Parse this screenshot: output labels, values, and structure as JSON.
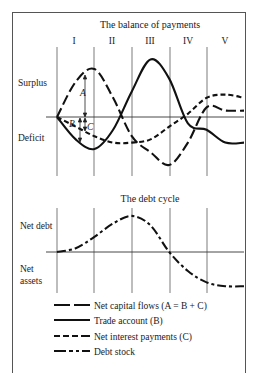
{
  "balance_chart": {
    "title": "The balance of payments",
    "phases": [
      "I",
      "II",
      "III",
      "IV",
      "V"
    ],
    "y_labels": {
      "top": "Surplus",
      "bottom": "Deficit"
    },
    "annotations": {
      "a": "A",
      "b": "B",
      "c": "C"
    }
  },
  "debt_chart": {
    "title": "The debt cycle",
    "y_labels": {
      "top": "Net debt",
      "bottom_line1": "Net",
      "bottom_line2": "assets"
    }
  },
  "legend": [
    {
      "style": "long-dash",
      "label": "Net capital flows (A = B + C)"
    },
    {
      "style": "solid",
      "label": "Trade account (B)"
    },
    {
      "style": "short-dash",
      "label": "Net interest payments (C)"
    },
    {
      "style": "dash-dot",
      "label": "Debt stock"
    }
  ],
  "chart_data": [
    {
      "type": "line",
      "title": "The balance of payments",
      "x": [
        0,
        0.5,
        1,
        1.5,
        2,
        2.5,
        3,
        3.5,
        4,
        4.5,
        5
      ],
      "categories": [
        "I",
        "II",
        "III",
        "IV",
        "V"
      ],
      "ylabel_top": "Surplus",
      "ylabel_bottom": "Deficit",
      "series": [
        {
          "name": "Net capital flows (A = B + C)",
          "values": [
            0,
            0.55,
            0.75,
            0.3,
            -0.3,
            -0.55,
            -0.75,
            -0.4,
            0.15,
            0.1,
            0.1
          ]
        },
        {
          "name": "Trade account (B)",
          "values": [
            0,
            -0.35,
            -0.5,
            -0.2,
            0.4,
            0.9,
            0.6,
            -0.1,
            -0.2,
            -0.4,
            -0.4
          ]
        },
        {
          "name": "Net interest payments (C)",
          "values": [
            0,
            -0.15,
            -0.3,
            -0.4,
            -0.4,
            -0.35,
            -0.15,
            0.05,
            0.3,
            0.35,
            0.3
          ]
        }
      ]
    },
    {
      "type": "line",
      "title": "The debt cycle",
      "x": [
        0,
        0.5,
        1,
        1.5,
        2,
        2.5,
        3,
        3.5,
        4,
        4.5,
        5
      ],
      "ylabel_top": "Net debt",
      "ylabel_bottom": "Net assets",
      "series": [
        {
          "name": "Debt stock",
          "values": [
            0,
            0.1,
            0.4,
            0.75,
            0.95,
            0.7,
            0.0,
            -0.5,
            -0.8,
            -0.9,
            -0.9
          ]
        }
      ]
    }
  ]
}
